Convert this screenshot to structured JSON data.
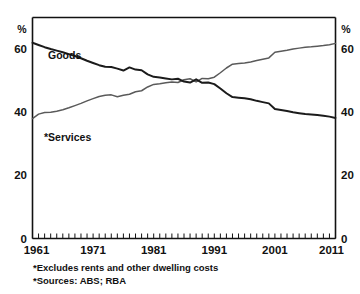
{
  "chart_data": {
    "type": "line",
    "title": "",
    "subtitle": "",
    "xlabel": "",
    "ylabel": "",
    "y_unit_label": "%",
    "ylim": [
      0,
      70
    ],
    "yticks": [
      0,
      20,
      40,
      60
    ],
    "ytick_labels": [
      "0",
      "20",
      "40",
      "60"
    ],
    "xlim": [
      1961,
      2011
    ],
    "xticks": [
      1961,
      1971,
      1981,
      1991,
      2001,
      2011
    ],
    "xtick_labels": [
      "1961",
      "1971",
      "1981",
      "1991",
      "2001",
      "2011"
    ],
    "minor_xtick_interval": 1,
    "grid": false,
    "legend_position": "inline-annotation",
    "dual_y_axis": true,
    "series": [
      {
        "name": "Goods",
        "label": "Goods",
        "color": "#1b1b1b",
        "x": [
          1961,
          1962,
          1963,
          1964,
          1965,
          1966,
          1967,
          1968,
          1969,
          1970,
          1971,
          1972,
          1973,
          1974,
          1975,
          1976,
          1977,
          1978,
          1979,
          1980,
          1981,
          1982,
          1983,
          1984,
          1985,
          1986,
          1987,
          1988,
          1989,
          1990,
          1991,
          1992,
          1993,
          1994,
          1995,
          1996,
          1997,
          1998,
          1999,
          2000,
          2001,
          2002,
          2003,
          2004,
          2005,
          2006,
          2007,
          2008,
          2009,
          2010,
          2011
        ],
        "values": [
          62.0,
          61.3,
          60.6,
          60.0,
          59.5,
          59.0,
          58.4,
          57.8,
          57.1,
          56.3,
          55.6,
          54.9,
          54.4,
          54.3,
          53.8,
          53.2,
          54.2,
          53.5,
          53.3,
          52.0,
          51.2,
          51.0,
          50.7,
          50.4,
          50.6,
          49.7,
          49.4,
          50.4,
          49.3,
          49.4,
          48.9,
          47.5,
          46.0,
          44.8,
          44.6,
          44.4,
          44.1,
          43.6,
          43.2,
          42.8,
          41.0,
          40.7,
          40.4,
          40.0,
          39.7,
          39.4,
          39.3,
          39.1,
          38.9,
          38.6,
          38.2
        ]
      },
      {
        "name": "Services",
        "label": "*Services",
        "color": "#5a5a5a",
        "x": [
          1961,
          1962,
          1963,
          1964,
          1965,
          1966,
          1967,
          1968,
          1969,
          1970,
          1971,
          1972,
          1973,
          1974,
          1975,
          1976,
          1977,
          1978,
          1979,
          1980,
          1981,
          1982,
          1983,
          1984,
          1985,
          1986,
          1987,
          1988,
          1989,
          1990,
          1991,
          1992,
          1993,
          1994,
          1995,
          1996,
          1997,
          1998,
          1999,
          2000,
          2001,
          2002,
          2003,
          2004,
          2005,
          2006,
          2007,
          2008,
          2009,
          2010,
          2011
        ],
        "values": [
          38.0,
          39.4,
          39.9,
          40.0,
          40.3,
          40.8,
          41.4,
          42.1,
          42.8,
          43.6,
          44.3,
          45.0,
          45.4,
          45.5,
          44.9,
          45.4,
          45.7,
          46.5,
          46.8,
          48.0,
          48.8,
          49.0,
          49.3,
          49.6,
          49.4,
          50.3,
          50.6,
          49.6,
          50.7,
          50.6,
          51.1,
          52.5,
          54.0,
          55.2,
          55.4,
          55.6,
          55.9,
          56.4,
          56.8,
          57.2,
          59.0,
          59.3,
          59.6,
          60.0,
          60.3,
          60.6,
          60.7,
          60.9,
          61.1,
          61.4,
          61.8
        ]
      }
    ],
    "annotations": [
      {
        "name": "goods-series-label",
        "text": "Goods",
        "x_px": 48,
        "y_px": 59
      },
      {
        "name": "services-series-label",
        "text": "*Services",
        "x_px": 44,
        "y_px": 141
      }
    ],
    "footnotes": [
      "*Excludes rents and other dwelling costs",
      "*Sources: ABS; RBA"
    ]
  },
  "axes": {
    "left_unit": "%",
    "right_unit": "%",
    "left_tick_labels": [
      "60",
      "40",
      "20",
      "0"
    ],
    "right_tick_labels": [
      "60",
      "40",
      "20",
      "0"
    ],
    "x_tick_labels": [
      "1961",
      "1971",
      "1981",
      "1991",
      "2001",
      "2011"
    ]
  },
  "footer": {
    "note_1": "*Excludes rents and other dwelling costs",
    "note_2": "*Sources: ABS; RBA"
  },
  "colors": {
    "goods": "#1b1b1b",
    "services": "#5a5a5a",
    "axis": "#111111",
    "background": "#ffffff"
  }
}
